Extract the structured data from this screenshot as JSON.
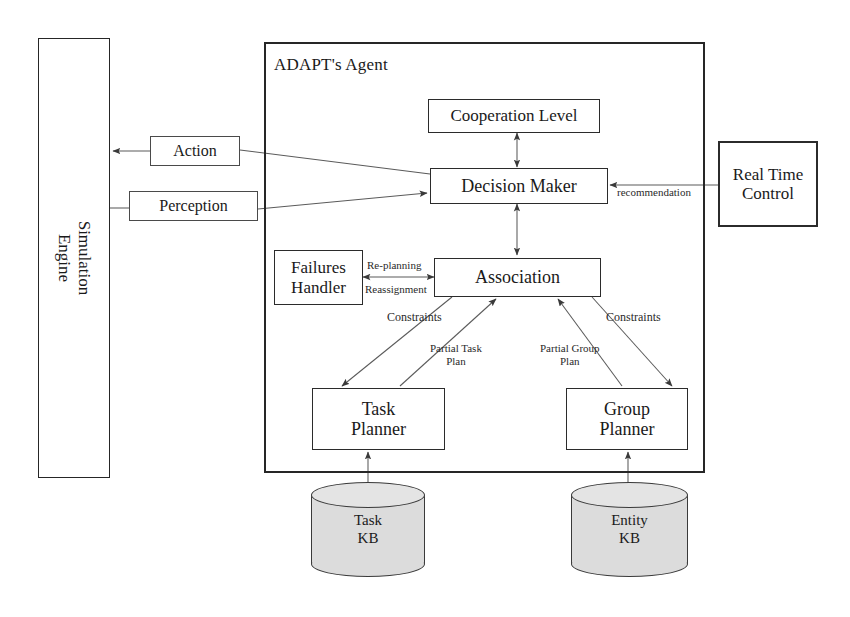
{
  "diagram": {
    "agent_boundary_label": "ADAPT's Agent",
    "colors": {
      "stroke": "#262626",
      "line": "#555555",
      "cylinder_fill": "#dcdcdc",
      "background": "#ffffff"
    }
  },
  "nodes": {
    "simulation_engine": {
      "line1": "Simulation",
      "line2": "Engine"
    },
    "action": {
      "label": "Action"
    },
    "perception": {
      "label": "Perception"
    },
    "cooperation_level": {
      "label": "Cooperation Level"
    },
    "decision_maker": {
      "label": "Decision Maker"
    },
    "real_time_control": {
      "line1": "Real Time",
      "line2": "Control"
    },
    "failures_handler": {
      "line1": "Failures",
      "line2": "Handler"
    },
    "association": {
      "label": "Association"
    },
    "task_planner": {
      "line1": "Task",
      "line2": "Planner"
    },
    "group_planner": {
      "line1": "Group",
      "line2": "Planner"
    },
    "task_kb": {
      "line1": "Task",
      "line2": "KB"
    },
    "entity_kb": {
      "line1": "Entity",
      "line2": "KB"
    }
  },
  "edge_labels": {
    "recommendation": "recommendation",
    "replanning": "Re-planning",
    "reassignment": "Reassignment",
    "constraints_left": "Constraints",
    "constraints_right": "Constraints",
    "partial_task_plan_line1": "Partial Task",
    "partial_task_plan_line2": "Plan",
    "partial_group_plan_line1": "Partial Group",
    "partial_group_plan_line2": "Plan"
  }
}
